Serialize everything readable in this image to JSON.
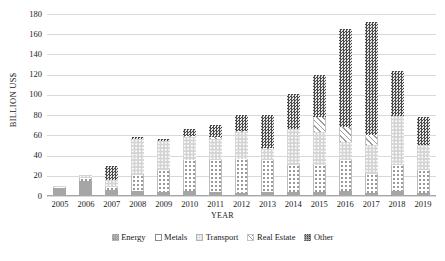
{
  "chart_data": {
    "type": "bar",
    "subtype": "stacked-bar",
    "title": "",
    "xlabel": "YEAR",
    "ylabel": "BILLION US$",
    "ylim": [
      0,
      180
    ],
    "ytick_step": 20,
    "yticks": [
      0,
      20,
      40,
      60,
      80,
      100,
      120,
      140,
      160,
      180
    ],
    "grid": true,
    "legend_position": "bottom",
    "categories": [
      "2005",
      "2006",
      "2007",
      "2008",
      "2009",
      "2010",
      "2011",
      "2012",
      "2013",
      "2014",
      "2015",
      "2016",
      "2017",
      "2018",
      "2019"
    ],
    "series": [
      {
        "name": "Energy",
        "color": "#a6a6a6",
        "pattern": "solid-gray",
        "values": [
          8,
          15,
          6,
          5,
          4,
          5,
          4,
          3,
          4,
          4,
          4,
          5,
          3,
          5,
          3
        ]
      },
      {
        "name": "Metals",
        "color": "#ffffff",
        "pattern": "white-dotted",
        "values": [
          1,
          3,
          3,
          16,
          22,
          31,
          32,
          34,
          32,
          27,
          27,
          31,
          19,
          26,
          23
        ]
      },
      {
        "name": "Transport",
        "color": "#d4d4d4",
        "pattern": "light-gray-dots",
        "values": [
          1,
          3,
          7,
          35,
          28,
          22,
          20,
          26,
          11,
          35,
          32,
          17,
          28,
          48,
          24
        ]
      },
      {
        "name": "Real Estate",
        "color": "#ffffff",
        "pattern": "diagonal-hatch",
        "values": [
          0,
          0,
          0,
          0,
          0,
          1,
          2,
          1,
          1,
          0,
          15,
          15,
          10,
          0,
          0
        ]
      },
      {
        "name": "Other",
        "color": "#4a4a4a",
        "pattern": "dark-checker",
        "values": [
          0,
          0,
          14,
          2,
          2,
          7,
          12,
          16,
          32,
          35,
          42,
          97,
          112,
          45,
          28
        ]
      }
    ],
    "totals": [
      10,
      21,
      30,
      58,
      56,
      66,
      70,
      80,
      80,
      101,
      120,
      165,
      172,
      124,
      78
    ]
  },
  "legend": {
    "items": [
      {
        "label": "Energy",
        "key": "energy"
      },
      {
        "label": "Metals",
        "key": "metals"
      },
      {
        "label": "Transport",
        "key": "transport"
      },
      {
        "label": "Real Estate",
        "key": "realestate"
      },
      {
        "label": "Other",
        "key": "other"
      }
    ]
  }
}
